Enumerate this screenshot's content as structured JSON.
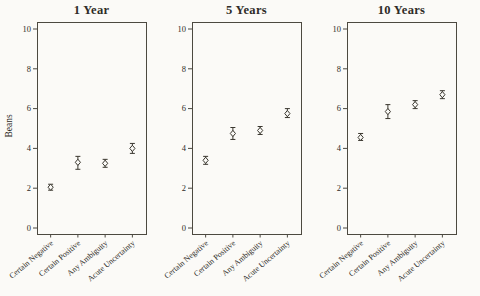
{
  "figure": {
    "background_color": "#fbfaf7"
  },
  "chart_data": {
    "type": "scatter",
    "subtype": "pointrange-with-error-bars",
    "marker": "open-diamond",
    "ylabel": "Beans",
    "xlabel": "",
    "ylim": [
      0,
      10
    ],
    "yticks": [
      0,
      2,
      4,
      6,
      8,
      10
    ],
    "grid": false,
    "legend": "none",
    "categories": [
      "Certain Negative",
      "Certain Positive",
      "Any Ambiguity",
      "Acute Uncertainty"
    ],
    "panels": [
      {
        "title": "1 Year",
        "points": [
          {
            "category": "Certain Negative",
            "mean": 2.05,
            "lo": 1.9,
            "hi": 2.2
          },
          {
            "category": "Certain Positive",
            "mean": 3.3,
            "lo": 2.95,
            "hi": 3.6
          },
          {
            "category": "Any Ambiguity",
            "mean": 3.25,
            "lo": 3.05,
            "hi": 3.45
          },
          {
            "category": "Acute Uncertainty",
            "mean": 4.0,
            "lo": 3.75,
            "hi": 4.25
          }
        ]
      },
      {
        "title": "5 Years",
        "points": [
          {
            "category": "Certain Negative",
            "mean": 3.4,
            "lo": 3.2,
            "hi": 3.6
          },
          {
            "category": "Certain Positive",
            "mean": 4.75,
            "lo": 4.45,
            "hi": 5.05
          },
          {
            "category": "Any Ambiguity",
            "mean": 4.9,
            "lo": 4.7,
            "hi": 5.1
          },
          {
            "category": "Acute Uncertainty",
            "mean": 5.75,
            "lo": 5.55,
            "hi": 6.0
          }
        ]
      },
      {
        "title": "10 Years",
        "points": [
          {
            "category": "Certain Negative",
            "mean": 4.55,
            "lo": 4.4,
            "hi": 4.75
          },
          {
            "category": "Certain Positive",
            "mean": 5.85,
            "lo": 5.5,
            "hi": 6.2
          },
          {
            "category": "Any Ambiguity",
            "mean": 6.2,
            "lo": 6.0,
            "hi": 6.4
          },
          {
            "category": "Acute Uncertainty",
            "mean": 6.7,
            "lo": 6.5,
            "hi": 6.9
          }
        ]
      }
    ],
    "colors": {
      "point_stroke": "#3a372f",
      "point_fill": "#fbfaf7",
      "error_bar": "#3a372f",
      "axis": "#4c4940",
      "text": "#2e2c27"
    }
  }
}
